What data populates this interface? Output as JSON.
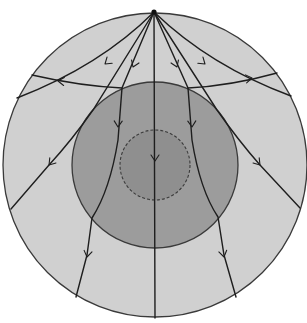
{
  "diagram": {
    "title": "",
    "type": "seismic ray paths through Earth's interior",
    "colors": {
      "background": "#ffffff",
      "mantle": "#d0d0d0",
      "outer_core": "#9c9c9c",
      "inner_core": "#8f8f8f",
      "outline": "#3a3a3a",
      "ray": "#1e1e1e"
    },
    "layers": [
      {
        "name": "mantle",
        "cx": 155,
        "cy": 165,
        "r": 152,
        "border": "solid"
      },
      {
        "name": "outer-core",
        "cx": 155,
        "cy": 165,
        "r": 83,
        "border": "solid"
      },
      {
        "name": "inner-core",
        "cx": 155,
        "cy": 165,
        "r": 35,
        "border": "dashed"
      }
    ],
    "source": {
      "name": "earthquake-focus",
      "x": 154,
      "y": 12
    },
    "rays": [
      {
        "name": "ray-center",
        "path": "M154,12 L155,318"
      },
      {
        "name": "ray-shallow-left",
        "path": "M154,12 Q100,66 17,98"
      },
      {
        "name": "ray-shallow-right",
        "path": "M154,12 Q210,66 291,96"
      },
      {
        "name": "ray-reflected-left",
        "path": "M32,75 Q80,86 122,88"
      },
      {
        "name": "ray-reflected-right",
        "path": "M188,88 Q230,86 277,73"
      },
      {
        "name": "ray-grazing-left",
        "path": "M154,12 L93,110 Q72,140 49,165 L11,209"
      },
      {
        "name": "ray-grazing-right",
        "path": "M154,12 L217,110 Q238,140 260,165 L300,208"
      },
      {
        "name": "ray-core-left",
        "path": "M154,12 L122,88 L118,140 Q110,190 92,218 L87,255 L76,297"
      },
      {
        "name": "ray-core-right",
        "path": "M154,12 L188,88 L192,140 Q200,190 218,217 L224,255 L236,297"
      }
    ],
    "arrows": [
      {
        "name": "arrow-shallow-left",
        "x": 105,
        "y": 64,
        "angle": 140
      },
      {
        "name": "arrow-shallow-right",
        "x": 205,
        "y": 64,
        "angle": 40
      },
      {
        "name": "arrow-reflected-left",
        "x": 58,
        "y": 81,
        "angle": 185
      },
      {
        "name": "arrow-reflected-right",
        "x": 252,
        "y": 78,
        "angle": -8
      },
      {
        "name": "arrow-core-left-upper",
        "x": 133,
        "y": 67,
        "angle": 112
      },
      {
        "name": "arrow-core-right-upper",
        "x": 177,
        "y": 67,
        "angle": 68
      },
      {
        "name": "arrow-core-left-mid",
        "x": 118,
        "y": 127,
        "angle": 92
      },
      {
        "name": "arrow-core-right-mid",
        "x": 192,
        "y": 127,
        "angle": 88
      },
      {
        "name": "arrow-center",
        "x": 155,
        "y": 161,
        "angle": 90
      },
      {
        "name": "arrow-grazing-left",
        "x": 49,
        "y": 165,
        "angle": 130
      },
      {
        "name": "arrow-grazing-right",
        "x": 260,
        "y": 165,
        "angle": 50
      },
      {
        "name": "arrow-core-left-lower",
        "x": 87,
        "y": 257,
        "angle": 100
      },
      {
        "name": "arrow-core-right-lower",
        "x": 224,
        "y": 257,
        "angle": 78
      }
    ]
  }
}
